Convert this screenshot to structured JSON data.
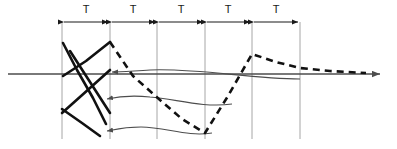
{
  "figure": {
    "background_color": "#ffffff",
    "width": 397,
    "height": 149
  },
  "axis": {
    "name": "time-axis",
    "y": 74,
    "x_start": 8,
    "x_end": 385,
    "color": "#4d4d4d",
    "stroke_width": 1.6,
    "arrowhead": "right"
  },
  "gridlines": {
    "color": "#a6a6a6",
    "stroke_width": 1,
    "y_top": 22,
    "y_bottom": 139,
    "x_positions": [
      62,
      110,
      157,
      205,
      252,
      300
    ]
  },
  "interval_markers": {
    "label": "T",
    "label_y": 10,
    "arrow_y": 22,
    "color": "#1a1a1a",
    "stroke_width": 1.2,
    "intervals": [
      {
        "label": "T",
        "x_start": 62,
        "x_end": 110,
        "label_x": 86
      },
      {
        "label": "T",
        "x_start": 110,
        "x_end": 157,
        "label_x": 133
      },
      {
        "label": "T",
        "x_start": 157,
        "x_end": 205,
        "label_x": 181
      },
      {
        "label": "T",
        "x_start": 205,
        "x_end": 252,
        "label_x": 228
      },
      {
        "label": "T",
        "x_start": 252,
        "x_end": 300,
        "label_x": 276
      }
    ]
  },
  "solid_traces": {
    "color": "#111111",
    "stroke_width": 2.6,
    "paths": [
      {
        "name": "solid-trace-falling-a",
        "points": "63,43 77,70 93,98 106,124"
      },
      {
        "name": "solid-trace-rising-a",
        "points": "63,76 86,61 110,42"
      },
      {
        "name": "solid-trace-rising-b",
        "points": "62,113 90,88 110,70"
      },
      {
        "name": "solid-trace-falling-b",
        "points": "62,109 82,123 100,136"
      },
      {
        "name": "solid-trace-crossing-c",
        "points": "70,51 90,82 110,113"
      }
    ]
  },
  "dashed_trace": {
    "name": "dashed-response-curve",
    "color": "#111111",
    "stroke_width": 2.6,
    "dash_pattern": "7 5",
    "points": "110,42 133,76 160,100 182,119 205,133 228,96 252,54 276,62 300,68 330,71 366,73"
  },
  "thin_curves": {
    "color": "#4d4d4d",
    "stroke_width": 1.1,
    "arrows": [
      {
        "name": "annotation-arrow-upper",
        "path": "M 300,79 C 250,79 200,68 150,70 C 130,71 118,72 109,72",
        "arrow_x": 109,
        "arrow_y": 72
      },
      {
        "name": "annotation-arrow-middle",
        "path": "M 230,104 C 200,108 175,99 150,97 C 130,95 115,97 104,99",
        "arrow_x": 104,
        "arrow_y": 99
      },
      {
        "name": "annotation-arrow-lower",
        "path": "M 210,133 C 185,137 165,127 140,127 C 122,127 112,130 104,131",
        "arrow_x": 104,
        "arrow_y": 131
      }
    ]
  }
}
